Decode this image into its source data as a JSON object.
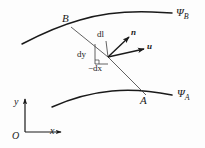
{
  "figure": {
    "type": "vector-diagram",
    "background_color": "#fdfdfd",
    "stroke_color": "#1a1a1a",
    "width": 205,
    "height": 148
  },
  "labels": {
    "point_b": "B",
    "point_a": "A",
    "stream_b_symbol": "Ψ",
    "stream_b_sub": "B",
    "stream_a_symbol": "Ψ",
    "stream_a_sub": "A",
    "dl": "dl",
    "dy": "dy",
    "dx": "−dx",
    "vector_n": "n",
    "vector_u": "u",
    "axis_y": "y",
    "axis_x": "x",
    "axis_origin": "O"
  },
  "geometry": {
    "upper_streamline": "M 22,44 C 45,32 62,25 80,20 C 100,14 125,11 152,12 L 172,13",
    "lower_streamline": "M 52,107 C 70,99 90,93 112,91 C 132,89 152,91 172,95",
    "connector_line": "M 71,27 L 108,57 L 146,95",
    "vector_n": {
      "x1": 108,
      "y1": 57,
      "x2": 130,
      "y2": 36
    },
    "vector_u": {
      "x1": 108,
      "y1": 57,
      "x2": 145,
      "y2": 49
    },
    "leader_dl": {
      "x1": 108,
      "y1": 57,
      "x2": 104,
      "y2": 42
    },
    "dy_tick": "M 95,44 L 95,64 L 108,64",
    "axis_y_line": {
      "x1": 25,
      "y1": 132,
      "x2": 25,
      "y2": 98
    },
    "axis_x_line": {
      "x1": 25,
      "y1": 132,
      "x2": 62,
      "y2": 132
    }
  },
  "positions": {
    "point_b": {
      "left": 62,
      "top": 14
    },
    "point_a": {
      "left": 140,
      "top": 95
    },
    "stream_b": {
      "left": 176,
      "top": 8
    },
    "stream_a": {
      "left": 177,
      "top": 89
    },
    "dl": {
      "left": 97,
      "top": 31
    },
    "dy": {
      "left": 78,
      "top": 50
    },
    "dx": {
      "left": 89,
      "top": 63
    },
    "vector_n": {
      "left": 131,
      "top": 29
    },
    "vector_u": {
      "left": 148,
      "top": 43
    },
    "axis_y": {
      "left": 15,
      "top": 98
    },
    "axis_x": {
      "left": 50,
      "top": 127
    },
    "axis_origin": {
      "left": 13,
      "top": 131
    }
  }
}
